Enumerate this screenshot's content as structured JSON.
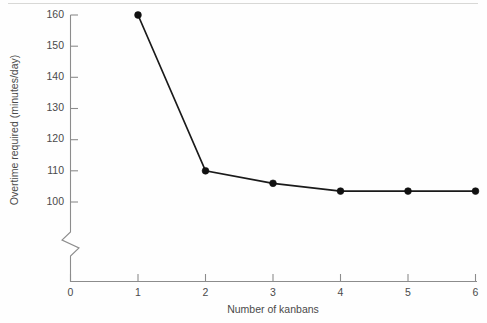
{
  "figure": {
    "background_color": "#fefefe",
    "line_color": "#1a1a1a",
    "marker_color": "#111111",
    "axis_color": "#8c8c8c",
    "text_color": "#4a4a4a"
  },
  "chart_data": {
    "type": "line",
    "title": "",
    "subtitle": "",
    "xlabel": "Number of kanbans",
    "ylabel": "Overtime required (minutes/day)",
    "x": [
      1,
      2,
      3,
      4,
      5,
      6
    ],
    "values": [
      160,
      110,
      106,
      103.5,
      103.5,
      103.5
    ],
    "series": [
      {
        "name": "Overtime required",
        "x": [
          1,
          2,
          3,
          4,
          5,
          6
        ],
        "values": [
          160,
          110,
          106,
          103.5,
          103.5,
          103.5
        ]
      }
    ],
    "xlim": [
      0,
      6
    ],
    "ylim": [
      100,
      160
    ],
    "xticks": [
      0,
      1,
      2,
      3,
      4,
      5,
      6
    ],
    "xticklabels": [
      "0",
      "1",
      "2",
      "3",
      "4",
      "5",
      "6"
    ],
    "yticks": [
      100,
      110,
      120,
      130,
      140,
      150,
      160
    ],
    "yticklabels": [
      "100",
      "110",
      "120",
      "130",
      "140",
      "150",
      "160"
    ],
    "grid": false,
    "legend": null,
    "legend_position": "none",
    "axis_break": {
      "axis": "y",
      "label": "zigzag-break",
      "below_value": 100
    },
    "markers": "filled-circle",
    "annotations": []
  },
  "axes": {
    "y_tick_labels": [
      "160",
      "150",
      "140",
      "130",
      "120",
      "110",
      "100"
    ],
    "x_tick_labels": [
      "0",
      "1",
      "2",
      "3",
      "4",
      "5",
      "6"
    ],
    "y_title": "Overtime required (minutes/day)",
    "x_title": "Number of kanbans"
  }
}
